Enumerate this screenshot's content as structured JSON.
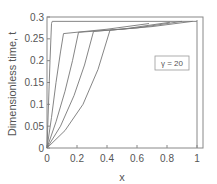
{
  "chart_data": {
    "type": "line",
    "title": "",
    "xlabel": "x",
    "ylabel": "Dimensionless time, t",
    "xlim": [
      0,
      1
    ],
    "ylim": [
      0,
      0.3
    ],
    "xticks": [
      "0",
      "0.2",
      "0.4",
      "0.6",
      "0.8",
      "1"
    ],
    "yticks": [
      "0",
      "0.05",
      "0.1",
      "0.15",
      "0.2",
      "0.25",
      "0.3"
    ],
    "grid": false,
    "legend": {
      "text": "γ = 20",
      "position": "inside-right"
    },
    "series": [
      {
        "name": "curve-1",
        "x": [
          0,
          0.01,
          0.02,
          0.03,
          0.035,
          1.0
        ],
        "y": [
          0,
          0.1,
          0.2,
          0.285,
          0.29,
          0.29
        ]
      },
      {
        "name": "curve-2",
        "x": [
          0,
          0.03,
          0.06,
          0.09,
          0.11,
          0.4,
          0.68
        ],
        "y": [
          0,
          0.07,
          0.15,
          0.22,
          0.262,
          0.272,
          0.285
        ]
      },
      {
        "name": "curve-3",
        "x": [
          0,
          0.06,
          0.12,
          0.17,
          0.21,
          0.5,
          0.82
        ],
        "y": [
          0,
          0.06,
          0.13,
          0.2,
          0.265,
          0.272,
          0.288
        ]
      },
      {
        "name": "curve-4",
        "x": [
          0,
          0.09,
          0.18,
          0.25,
          0.31,
          0.6,
          0.9
        ],
        "y": [
          0,
          0.05,
          0.12,
          0.19,
          0.267,
          0.275,
          0.29
        ]
      },
      {
        "name": "curve-5",
        "x": [
          0,
          0.12,
          0.24,
          0.34,
          0.42,
          0.7,
          0.97
        ],
        "y": [
          0,
          0.04,
          0.1,
          0.18,
          0.27,
          0.278,
          0.29
        ]
      }
    ],
    "vertical_line": {
      "x": 1.0
    }
  }
}
